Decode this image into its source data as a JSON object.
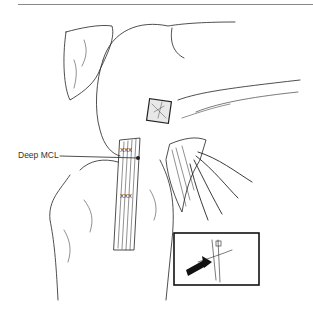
{
  "figure": {
    "labels": {
      "deep_mcl": "Deep MCL"
    },
    "inset": {
      "description": "inset box with arrow showing suture detail"
    },
    "colors": {
      "line": "#222222",
      "background": "#ffffff"
    }
  }
}
